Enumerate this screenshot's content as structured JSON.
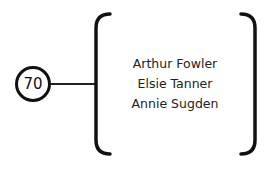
{
  "diagram": {
    "node": {
      "label": "70"
    },
    "group": {
      "members": [
        "Arthur Fowler",
        "Elsie Tanner",
        "Annie Sugden"
      ]
    },
    "colors": {
      "stroke": "#111111",
      "text": "#222222",
      "background": "#ffffff"
    }
  }
}
